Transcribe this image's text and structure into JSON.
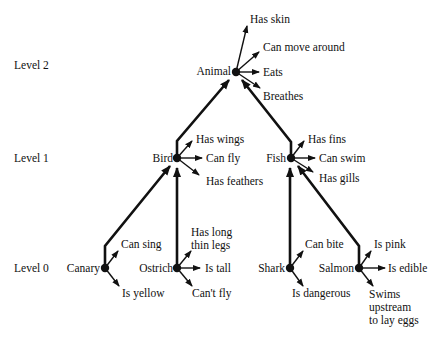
{
  "levels": [
    {
      "label": "Level 2"
    },
    {
      "label": "Level 1"
    },
    {
      "label": "Level 0"
    }
  ],
  "nodes": {
    "animal": {
      "name": "Animal",
      "properties": [
        "Has skin",
        "Can move around",
        "Eats",
        "Breathes"
      ]
    },
    "bird": {
      "name": "Bird",
      "properties": [
        "Has wings",
        "Can fly",
        "Has feathers"
      ]
    },
    "fish": {
      "name": "Fish",
      "properties": [
        "Has fins",
        "Can swim",
        "Has gills"
      ]
    },
    "canary": {
      "name": "Canary",
      "properties": [
        "Can sing",
        "Is yellow"
      ]
    },
    "ostrich": {
      "name": "Ostrich",
      "properties": [
        "Has long",
        "thin legs",
        "Is tall",
        "Can't fly"
      ]
    },
    "shark": {
      "name": "Shark",
      "properties": [
        "Can bite",
        "Is dangerous"
      ]
    },
    "salmon": {
      "name": "Salmon",
      "properties": [
        "Is pink",
        "Is edible",
        "Swims",
        "upstream",
        "to lay eggs"
      ]
    }
  },
  "edges": [
    {
      "from": "Bird",
      "to": "Animal"
    },
    {
      "from": "Fish",
      "to": "Animal"
    },
    {
      "from": "Canary",
      "to": "Bird"
    },
    {
      "from": "Ostrich",
      "to": "Bird"
    },
    {
      "from": "Shark",
      "to": "Fish"
    },
    {
      "from": "Salmon",
      "to": "Fish"
    }
  ]
}
